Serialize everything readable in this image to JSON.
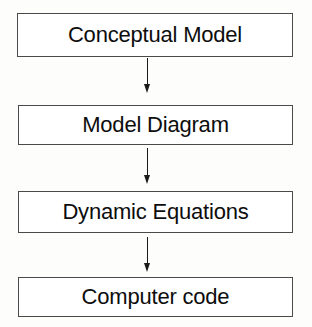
{
  "diagram": {
    "type": "vertical-flowchart",
    "background_color": "#fdfdfc",
    "box_border_color": "#4a4a4a",
    "box_fill_color": "#ffffff",
    "text_color": "#0d0d0d",
    "arrow_color": "#1a1a1a",
    "nodes": [
      {
        "id": "conceptual-model",
        "label": "Conceptual Model"
      },
      {
        "id": "model-diagram",
        "label": "Model Diagram"
      },
      {
        "id": "dynamic-equations",
        "label": "Dynamic Equations"
      },
      {
        "id": "computer-code",
        "label": "Computer code"
      }
    ],
    "connectors": [
      {
        "id": "arrow-1",
        "from": "conceptual-model",
        "to": "model-diagram",
        "direction": "down",
        "style": "solid-filled-head"
      },
      {
        "id": "arrow-2",
        "from": "model-diagram",
        "to": "dynamic-equations",
        "direction": "down",
        "style": "solid-filled-head"
      },
      {
        "id": "arrow-3",
        "from": "dynamic-equations",
        "to": "computer-code",
        "direction": "down",
        "style": "solid-filled-head"
      }
    ]
  }
}
